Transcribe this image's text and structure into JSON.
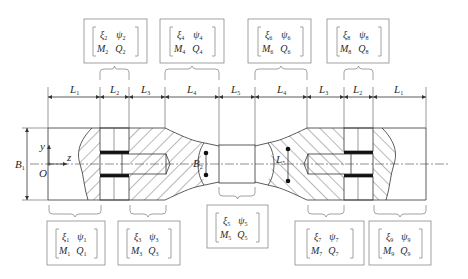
{
  "figure": {
    "axes": {
      "y_label": "y",
      "z_label": "z",
      "origin_label": "O"
    },
    "dimensions": {
      "top": [
        {
          "name": "L",
          "sub": "1"
        },
        {
          "name": "L",
          "sub": "2"
        },
        {
          "name": "L",
          "sub": "3"
        },
        {
          "name": "L",
          "sub": "4"
        },
        {
          "name": "L",
          "sub": "5"
        },
        {
          "name": "L",
          "sub": "4"
        },
        {
          "name": "L",
          "sub": "3"
        },
        {
          "name": "L",
          "sub": "2"
        },
        {
          "name": "L",
          "sub": "1"
        }
      ],
      "height_left": {
        "name": "B",
        "sub": "1"
      },
      "neck_left": {
        "name": "B",
        "sub": "2"
      },
      "neck_right": {
        "name": "L",
        "sub": "5"
      }
    },
    "state_boxes_top": [
      {
        "index": "2",
        "xi": "ξ",
        "psi": "ψ",
        "M": "M",
        "Q": "Q"
      },
      {
        "index": "4",
        "xi": "ξ",
        "psi": "ψ",
        "M": "M",
        "Q": "Q"
      },
      {
        "index": "6",
        "xi": "ξ",
        "psi": "ψ",
        "M": "M",
        "Q": "Q"
      },
      {
        "index": "8",
        "xi": "ξ",
        "psi": "ψ",
        "M": "M",
        "Q": "Q"
      }
    ],
    "state_boxes_bottom": [
      {
        "index": "1",
        "xi": "ξ",
        "psi": "ψ",
        "M": "M",
        "Q": "Q"
      },
      {
        "index": "3",
        "xi": "ξ",
        "psi": "ψ",
        "M": "M",
        "Q": "Q"
      },
      {
        "index": "5",
        "xi": "ξ",
        "psi": "ψ",
        "M": "M",
        "Q": "Q"
      },
      {
        "index": "7",
        "xi": "ξ",
        "psi": "ψ",
        "M": "M",
        "Q": "Q"
      },
      {
        "index": "9",
        "xi": "ξ",
        "psi": "ψ",
        "M": "M",
        "Q": "Q"
      }
    ],
    "colors": {
      "line": "#333333",
      "box": "#8a8a8a",
      "background": "#ffffff"
    }
  }
}
